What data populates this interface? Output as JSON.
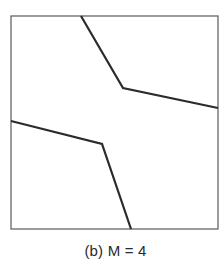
{
  "caption": "(b) M = 4",
  "diagram": {
    "frame": {
      "x1": 11,
      "y1": 16,
      "x2": 218,
      "y2": 229,
      "stroke": "#555555"
    },
    "boundaries": [
      {
        "name": "upper-boundary",
        "points": [
          [
            81,
            16
          ],
          [
            123,
            88
          ],
          [
            218,
            108
          ]
        ]
      },
      {
        "name": "lower-boundary",
        "points": [
          [
            11,
            121
          ],
          [
            102,
            144
          ],
          [
            131,
            229
          ]
        ]
      }
    ],
    "line_color": "#2b2b2b"
  }
}
